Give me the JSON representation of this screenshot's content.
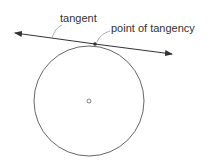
{
  "diagram": {
    "labels": {
      "tangent": "tangent",
      "point_of_tangency": "point of tangency"
    },
    "colors": {
      "stroke": "#555555",
      "text": "#333333"
    }
  }
}
